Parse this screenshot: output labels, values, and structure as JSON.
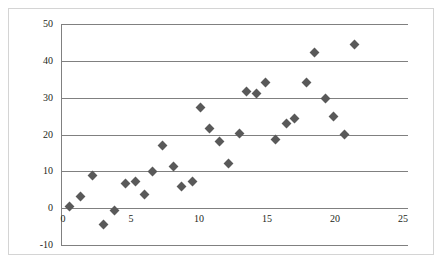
{
  "chart_data": {
    "type": "scatter",
    "title": "",
    "subtitle": "",
    "xlabel": "",
    "ylabel": "",
    "xlim": [
      0,
      25
    ],
    "ylim": [
      -10,
      50
    ],
    "xticks": [
      0,
      5,
      10,
      15,
      20,
      25
    ],
    "yticks": [
      -10,
      0,
      10,
      20,
      30,
      40,
      50
    ],
    "xtick_labels": [
      "0",
      "5",
      "10",
      "15",
      "20",
      "25"
    ],
    "ytick_labels": [
      "-10",
      "0",
      "10",
      "20",
      "30",
      "40",
      "50"
    ],
    "grid": "horizontal",
    "legend": null,
    "marker": "diamond",
    "marker_color": "#595959",
    "grid_color": "#808080",
    "axis_color": "#808080",
    "frame_color": "#d4d4d4",
    "background": "#ffffff",
    "points": [
      {
        "x": 0.5,
        "y": 0.5
      },
      {
        "x": 1.3,
        "y": 3.2
      },
      {
        "x": 2.2,
        "y": 8.9
      },
      {
        "x": 3.0,
        "y": -4.3
      },
      {
        "x": 3.8,
        "y": -0.6
      },
      {
        "x": 4.6,
        "y": 6.6
      },
      {
        "x": 5.3,
        "y": 7.3
      },
      {
        "x": 6.0,
        "y": 3.6
      },
      {
        "x": 6.6,
        "y": 9.9
      },
      {
        "x": 7.3,
        "y": 17.0
      },
      {
        "x": 8.1,
        "y": 11.4
      },
      {
        "x": 8.7,
        "y": 5.9
      },
      {
        "x": 9.5,
        "y": 7.3
      },
      {
        "x": 10.1,
        "y": 27.2
      },
      {
        "x": 10.8,
        "y": 21.7
      },
      {
        "x": 11.5,
        "y": 18.2
      },
      {
        "x": 12.2,
        "y": 12.2
      },
      {
        "x": 13.0,
        "y": 20.3
      },
      {
        "x": 13.5,
        "y": 31.7
      },
      {
        "x": 14.2,
        "y": 31.2
      },
      {
        "x": 14.9,
        "y": 34.0
      },
      {
        "x": 15.6,
        "y": 18.6
      },
      {
        "x": 16.4,
        "y": 22.9
      },
      {
        "x": 17.0,
        "y": 24.4
      },
      {
        "x": 17.9,
        "y": 34.1
      },
      {
        "x": 18.5,
        "y": 42.3
      },
      {
        "x": 19.3,
        "y": 29.7
      },
      {
        "x": 19.9,
        "y": 24.8
      },
      {
        "x": 20.7,
        "y": 20.1
      },
      {
        "x": 21.4,
        "y": 44.4
      }
    ]
  }
}
